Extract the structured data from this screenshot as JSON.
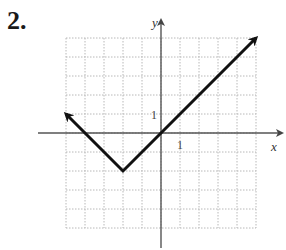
{
  "problem": {
    "number": "2."
  },
  "chart_data": {
    "type": "line",
    "title": "",
    "xlabel": "x",
    "ylabel": "y",
    "xlim": [
      -5,
      5
    ],
    "ylim": [
      -5,
      5
    ],
    "grid": true,
    "tick_labels": {
      "x": "1",
      "y": "1"
    },
    "series": [
      {
        "name": "y = |x + 2| - 2",
        "points": [
          [
            -5,
            1
          ],
          [
            -2,
            -2
          ],
          [
            0,
            0
          ],
          [
            5,
            5
          ]
        ],
        "arrows": [
          "start",
          "end"
        ]
      }
    ],
    "vertex": [
      -2,
      -2
    ]
  },
  "colors": {
    "grid": "#b8b8b8",
    "axis": "#555555",
    "curve": "#111111"
  }
}
